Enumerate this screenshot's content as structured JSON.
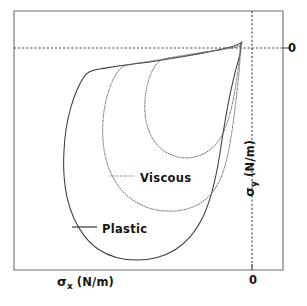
{
  "figure": {
    "name": "stress-locus-plot",
    "background": "#ffffff",
    "frame_color": "#6e6e6e"
  },
  "axes": {
    "x": {
      "symbol": "σ",
      "subscript": "x",
      "unit": "(N/m)",
      "zero_label": "0"
    },
    "y": {
      "symbol": "σ",
      "subscript": "y",
      "unit": "(N/m)",
      "zero_label": "0"
    }
  },
  "legend": {
    "entries": [
      {
        "label": "Viscous",
        "style": "dotted",
        "color": "#5f5f5f"
      },
      {
        "label": "Plastic",
        "style": "solid",
        "color": "#2f2f2f"
      }
    ]
  },
  "chart_data": {
    "type": "line",
    "title": "",
    "xlabel": "σx (N/m)",
    "ylabel": "σy (N/m)",
    "xlim": [
      0,
      1
    ],
    "ylim": [
      0,
      1
    ],
    "grid": false,
    "legend_position": "inside-center",
    "reference_lines": [
      {
        "name": "y-zero-dashed",
        "orientation": "horizontal",
        "value": 0,
        "style": "dashed"
      },
      {
        "name": "x-zero-dashed",
        "orientation": "vertical",
        "value": 0,
        "style": "dashed"
      }
    ],
    "series": [
      {
        "name": "Plastic",
        "style": "solid",
        "closed": true,
        "description": "outer teardrop yield locus closing at origin",
        "points": [
          [
            0.952,
            0.02
          ],
          [
            0.905,
            0.004
          ],
          [
            0.8,
            -0.016
          ],
          [
            0.69,
            -0.034
          ],
          [
            0.56,
            -0.052
          ],
          [
            0.44,
            -0.066
          ],
          [
            0.35,
            -0.078
          ],
          [
            0.3,
            -0.086
          ],
          [
            0.268,
            -0.1
          ],
          [
            0.232,
            -0.15
          ],
          [
            0.2,
            -0.225
          ],
          [
            0.178,
            -0.31
          ],
          [
            0.168,
            -0.4
          ],
          [
            0.168,
            -0.49
          ],
          [
            0.182,
            -0.58
          ],
          [
            0.212,
            -0.66
          ],
          [
            0.258,
            -0.728
          ],
          [
            0.32,
            -0.78
          ],
          [
            0.4,
            -0.812
          ],
          [
            0.49,
            -0.822
          ],
          [
            0.58,
            -0.812
          ],
          [
            0.66,
            -0.782
          ],
          [
            0.728,
            -0.73
          ],
          [
            0.782,
            -0.656
          ],
          [
            0.82,
            -0.566
          ],
          [
            0.848,
            -0.46
          ],
          [
            0.872,
            -0.33
          ],
          [
            0.898,
            -0.2
          ],
          [
            0.925,
            -0.095
          ],
          [
            0.948,
            -0.02
          ],
          [
            0.952,
            0.02
          ]
        ]
      },
      {
        "name": "Viscous-outer",
        "style": "dotted",
        "closed": true,
        "description": "middle dotted teardrop loop",
        "points": [
          [
            0.95,
            0.012
          ],
          [
            0.88,
            -0.002
          ],
          [
            0.78,
            -0.02
          ],
          [
            0.67,
            -0.036
          ],
          [
            0.56,
            -0.05
          ],
          [
            0.47,
            -0.062
          ],
          [
            0.42,
            -0.078
          ],
          [
            0.386,
            -0.122
          ],
          [
            0.358,
            -0.19
          ],
          [
            0.342,
            -0.268
          ],
          [
            0.34,
            -0.346
          ],
          [
            0.352,
            -0.424
          ],
          [
            0.382,
            -0.496
          ],
          [
            0.428,
            -0.556
          ],
          [
            0.492,
            -0.6
          ],
          [
            0.568,
            -0.626
          ],
          [
            0.65,
            -0.632
          ],
          [
            0.726,
            -0.62
          ],
          [
            0.79,
            -0.59
          ],
          [
            0.84,
            -0.54
          ],
          [
            0.876,
            -0.47
          ],
          [
            0.9,
            -0.382
          ],
          [
            0.918,
            -0.282
          ],
          [
            0.932,
            -0.18
          ],
          [
            0.944,
            -0.082
          ],
          [
            0.95,
            0.012
          ]
        ]
      },
      {
        "name": "Viscous-inner",
        "style": "dotted",
        "closed": true,
        "description": "innermost dotted loop",
        "points": [
          [
            0.948,
            0.006
          ],
          [
            0.87,
            -0.006
          ],
          [
            0.76,
            -0.02
          ],
          [
            0.66,
            -0.034
          ],
          [
            0.596,
            -0.048
          ],
          [
            0.56,
            -0.086
          ],
          [
            0.536,
            -0.146
          ],
          [
            0.526,
            -0.212
          ],
          [
            0.53,
            -0.278
          ],
          [
            0.552,
            -0.338
          ],
          [
            0.592,
            -0.386
          ],
          [
            0.648,
            -0.416
          ],
          [
            0.712,
            -0.426
          ],
          [
            0.776,
            -0.414
          ],
          [
            0.83,
            -0.382
          ],
          [
            0.872,
            -0.33
          ],
          [
            0.9,
            -0.262
          ],
          [
            0.92,
            -0.186
          ],
          [
            0.934,
            -0.11
          ],
          [
            0.944,
            -0.044
          ],
          [
            0.948,
            0.006
          ]
        ]
      }
    ]
  }
}
